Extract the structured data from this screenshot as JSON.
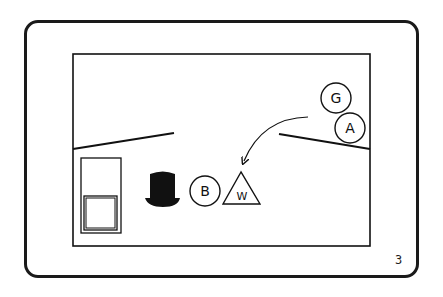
{
  "panel": {
    "page_number": "3",
    "colors": {
      "stroke": "#111111",
      "background": "#ffffff"
    }
  },
  "scene": {
    "characters": [
      {
        "id": "G",
        "label": "G",
        "shape": "circle"
      },
      {
        "id": "A",
        "label": "A",
        "shape": "circle"
      },
      {
        "id": "B",
        "label": "B",
        "shape": "circle"
      },
      {
        "id": "W",
        "label": "W",
        "shape": "triangle"
      }
    ],
    "objects": [
      {
        "id": "top-hat",
        "label": "top hat"
      },
      {
        "id": "door",
        "label": "door"
      },
      {
        "id": "movement-arrow",
        "label": "arrow from G/A toward W"
      }
    ]
  }
}
